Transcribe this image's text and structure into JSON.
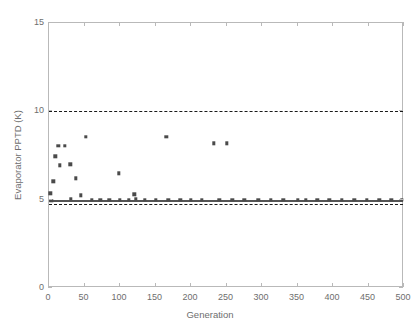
{
  "chart_data": {
    "type": "scatter",
    "title": "",
    "xlabel": "Generation",
    "ylabel": "Evaporator PPTD (K)",
    "xlim": [
      0,
      500
    ],
    "ylim": [
      0,
      15
    ],
    "xticks": [
      0,
      50,
      100,
      150,
      200,
      250,
      300,
      350,
      400,
      450,
      500
    ],
    "yticks": [
      0,
      5,
      10,
      15
    ],
    "grid": false,
    "legend": null,
    "marker": {
      "shape": "square",
      "color": "#4a4a4a",
      "size": 3.4
    },
    "reference_lines": [
      {
        "name": "upper-constraint",
        "y": 10.0,
        "style": "dashed",
        "color": "#1a1a1a"
      },
      {
        "name": "converged-optimum",
        "y": 5.0,
        "style": "solid",
        "color": "#555555"
      },
      {
        "name": "lower-constraint",
        "y": 4.78,
        "style": "dashed",
        "color": "#1a1a1a"
      }
    ],
    "points": [
      [
        2,
        5.35
      ],
      [
        3,
        4.95
      ],
      [
        6,
        6.05
      ],
      [
        9,
        7.45
      ],
      [
        13,
        8.05
      ],
      [
        15,
        6.95
      ],
      [
        22,
        8.05
      ],
      [
        30,
        7.0
      ],
      [
        31,
        5.05
      ],
      [
        38,
        6.2
      ],
      [
        45,
        5.25
      ],
      [
        52,
        8.55
      ],
      [
        60,
        5.0
      ],
      [
        72,
        5.0
      ],
      [
        85,
        5.0
      ],
      [
        98,
        6.5
      ],
      [
        100,
        5.0
      ],
      [
        112,
        5.0
      ],
      [
        120,
        5.3
      ],
      [
        122,
        5.05
      ],
      [
        135,
        5.0
      ],
      [
        150,
        5.0
      ],
      [
        165,
        8.55
      ],
      [
        168,
        5.0
      ],
      [
        185,
        5.0
      ],
      [
        200,
        5.0
      ],
      [
        215,
        5.0
      ],
      [
        232,
        8.2
      ],
      [
        240,
        5.0
      ],
      [
        250,
        8.2
      ],
      [
        258,
        5.0
      ],
      [
        275,
        5.0
      ],
      [
        295,
        5.0
      ],
      [
        312,
        5.0
      ],
      [
        330,
        5.0
      ],
      [
        350,
        5.0
      ],
      [
        362,
        5.0
      ],
      [
        378,
        5.0
      ],
      [
        395,
        5.0
      ],
      [
        412,
        5.0
      ],
      [
        430,
        5.0
      ],
      [
        448,
        5.0
      ],
      [
        465,
        5.0
      ],
      [
        482,
        5.0
      ],
      [
        497,
        5.0
      ]
    ]
  }
}
